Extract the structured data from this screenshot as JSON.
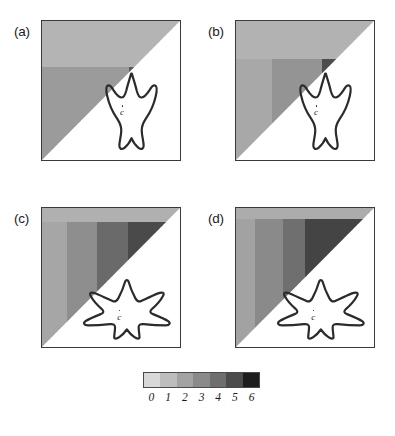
{
  "figure": {
    "width": 395,
    "height": 436,
    "background": "#ffffff"
  },
  "panels": [
    {
      "id": "a",
      "label": "(a)",
      "label_x": 14,
      "label_y": 24,
      "frame": {
        "x": 41,
        "y": 20,
        "w": 140,
        "h": 141
      },
      "shape": "three-lobed-footprint",
      "center_label": "c",
      "center_label_x": 0.565,
      "center_label_y": 0.62,
      "bands": [
        {
          "x0": 0.0,
          "x1": 1.0,
          "y0": 0.0,
          "y1": 0.33,
          "color": "#b4b4b4"
        },
        {
          "x0": 0.0,
          "x1": 0.63,
          "y0": 0.33,
          "y1": 1.0,
          "color": "#9b9b9b"
        },
        {
          "x0": 0.63,
          "x1": 1.0,
          "y0": 0.33,
          "y1": 1.0,
          "color": "#5a5a5a"
        }
      ]
    },
    {
      "id": "b",
      "label": "(b)",
      "label_x": 208,
      "label_y": 24,
      "frame": {
        "x": 235,
        "y": 20,
        "w": 140,
        "h": 141
      },
      "shape": "three-lobed-footprint",
      "center_label": "c",
      "center_label_x": 0.565,
      "center_label_y": 0.62,
      "bands": [
        {
          "x0": 0.0,
          "x1": 1.0,
          "y0": 0.0,
          "y1": 0.27,
          "color": "#b2b2b2"
        },
        {
          "x0": 0.0,
          "x1": 0.26,
          "y0": 0.27,
          "y1": 1.0,
          "color": "#a8a8a8"
        },
        {
          "x0": 0.26,
          "x1": 0.62,
          "y0": 0.27,
          "y1": 1.0,
          "color": "#949494"
        },
        {
          "x0": 0.62,
          "x1": 1.0,
          "y0": 0.27,
          "y1": 1.0,
          "color": "#4d4d4d"
        }
      ]
    },
    {
      "id": "c",
      "label": "(c)",
      "label_x": 14,
      "label_y": 211,
      "frame": {
        "x": 41,
        "y": 207,
        "w": 140,
        "h": 141
      },
      "shape": "five-pointed-star",
      "center_label": "c",
      "center_label_x": 0.545,
      "center_label_y": 0.745,
      "bands": [
        {
          "x0": 0.0,
          "x1": 1.0,
          "y0": 0.0,
          "y1": 0.1,
          "color": "#b0b0b0"
        },
        {
          "x0": 0.0,
          "x1": 0.18,
          "y0": 0.1,
          "y1": 1.0,
          "color": "#a6a6a6"
        },
        {
          "x0": 0.18,
          "x1": 0.4,
          "y0": 0.1,
          "y1": 1.0,
          "color": "#8e8e8e"
        },
        {
          "x0": 0.4,
          "x1": 0.62,
          "y0": 0.1,
          "y1": 1.0,
          "color": "#6a6a6a"
        },
        {
          "x0": 0.62,
          "x1": 1.0,
          "y0": 0.1,
          "y1": 1.0,
          "color": "#4a4a4a"
        }
      ]
    },
    {
      "id": "d",
      "label": "(d)",
      "label_x": 208,
      "label_y": 211,
      "frame": {
        "x": 235,
        "y": 207,
        "w": 140,
        "h": 141
      },
      "shape": "five-pointed-star",
      "center_label": "c",
      "center_label_x": 0.545,
      "center_label_y": 0.745,
      "bands": [
        {
          "x0": 0.0,
          "x1": 1.0,
          "y0": 0.0,
          "y1": 0.08,
          "color": "#acacac"
        },
        {
          "x0": 0.0,
          "x1": 0.14,
          "y0": 0.08,
          "y1": 1.0,
          "color": "#a2a2a2"
        },
        {
          "x0": 0.14,
          "x1": 0.34,
          "y0": 0.08,
          "y1": 1.0,
          "color": "#8a8a8a"
        },
        {
          "x0": 0.34,
          "x1": 0.5,
          "y0": 0.08,
          "y1": 1.0,
          "color": "#6f6f6f"
        },
        {
          "x0": 0.5,
          "x1": 1.0,
          "y0": 0.08,
          "y1": 1.0,
          "color": "#444444"
        }
      ]
    }
  ],
  "colorbar": {
    "x": 143,
    "y": 372,
    "w": 117,
    "h": 16,
    "colors": [
      "#d8d8d8",
      "#bdbdbd",
      "#a3a3a3",
      "#8a8a8a",
      "#6e6e6e",
      "#4c4c4c",
      "#1e1e1e"
    ],
    "tick_labels": [
      "0",
      "1",
      "2",
      "3",
      "4",
      "5",
      "6"
    ]
  },
  "chart_data": {
    "type": "heatmap",
    "title": "",
    "xlabel": "",
    "ylabel": "",
    "colorbar_levels": [
      0,
      1,
      2,
      3,
      4,
      5,
      6
    ],
    "colorbar_colors": [
      "#d8d8d8",
      "#bdbdbd",
      "#a3a3a3",
      "#8a8a8a",
      "#6e6e6e",
      "#4c4c4c",
      "#1e1e1e"
    ],
    "grid": false,
    "legend_position": "bottom",
    "panels": [
      {
        "id": "a",
        "label": "(a)",
        "region_levels": [
          1,
          2,
          4
        ],
        "shape": "three-lobed-footprint"
      },
      {
        "id": "b",
        "label": "(b)",
        "region_levels": [
          1,
          1,
          2,
          5
        ],
        "shape": "three-lobed-footprint"
      },
      {
        "id": "c",
        "label": "(c)",
        "region_levels": [
          1,
          2,
          3,
          4,
          5
        ],
        "shape": "five-pointed-star"
      },
      {
        "id": "d",
        "label": "(d)",
        "region_levels": [
          1,
          2,
          3,
          4,
          5
        ],
        "shape": "five-pointed-star"
      }
    ]
  }
}
